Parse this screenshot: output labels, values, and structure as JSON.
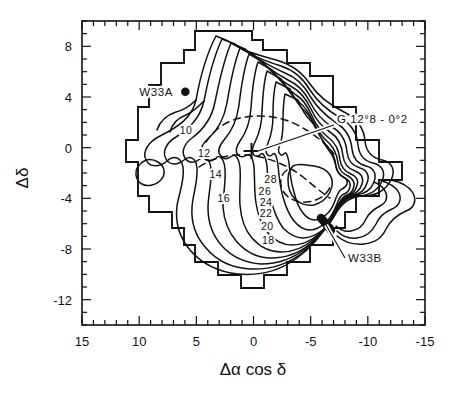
{
  "figure": {
    "kind": "contour-map",
    "caption_absent": true
  },
  "axes": {
    "x": {
      "label": "Δα  cos δ",
      "ticks": [
        15,
        10,
        5,
        0,
        -5,
        -10,
        -15
      ],
      "tick_labels": [
        "15",
        "10",
        "5",
        "0",
        "-5",
        "-10",
        "-15"
      ],
      "range": [
        15,
        -15
      ],
      "minor_step": 1,
      "direction": "reversed"
    },
    "y": {
      "label": "Δδ",
      "ticks": [
        8,
        4,
        0,
        -4,
        -8,
        -12
      ],
      "tick_labels": [
        "8",
        "4",
        "0",
        "-4",
        "-8",
        "-12"
      ],
      "range": [
        -14,
        10
      ],
      "minor_step": 1
    }
  },
  "chart_data": {
    "type": "contour",
    "title": "",
    "xlabel": "Δα  cos δ",
    "ylabel": "Δδ",
    "xlim": [
      15,
      -15
    ],
    "ylim": [
      -14,
      10
    ],
    "grid": false,
    "legend": "none",
    "contour_levels": [
      10,
      12,
      14,
      16,
      18,
      20,
      22,
      24,
      26,
      28
    ],
    "contour_label_values": [
      "10",
      "12",
      "14",
      "16",
      "18",
      "20",
      "22",
      "24",
      "26",
      "28"
    ],
    "level_step": 2,
    "peak_level": 28,
    "dashed_contours_present": true,
    "contour_labels": [
      {
        "text": "10",
        "x": 5.9,
        "y": 1.1
      },
      {
        "text": "12",
        "x": 4.3,
        "y": -0.7
      },
      {
        "text": "14",
        "x": 3.3,
        "y": -2.4
      },
      {
        "text": "16",
        "x": 2.6,
        "y": -4.3
      },
      {
        "text": "18",
        "x": -1.3,
        "y": -7.6
      },
      {
        "text": "20",
        "x": -1.2,
        "y": -6.5
      },
      {
        "text": "22",
        "x": -1.1,
        "y": -5.5
      },
      {
        "text": "24",
        "x": -1.1,
        "y": -4.6
      },
      {
        "text": "26",
        "x": -1.0,
        "y": -3.7
      },
      {
        "text": "28",
        "x": -1.5,
        "y": -2.8
      }
    ]
  },
  "markers": [
    {
      "name": "W33A",
      "label": "W33A",
      "symbol": "filled-circle",
      "x": 6.0,
      "y": 4.0
    },
    {
      "name": "W33B",
      "label": "W33B",
      "symbol": "filled-blob",
      "x": -4.6,
      "y": -6.1
    },
    {
      "name": "G12.8-0.2",
      "label": "G 12°8 - 0°2",
      "symbol": "plus",
      "x": 0.0,
      "y": 0.0
    }
  ],
  "annotations": [
    {
      "text": "W33A",
      "x": 8.6,
      "y": 4.0,
      "anchor": "end",
      "leader": false
    },
    {
      "text": "G 12°8 - 0°2",
      "x": -7.4,
      "y": 2.6,
      "anchor": "start",
      "leader": true
    },
    {
      "text": "W33B",
      "x": -7.6,
      "y": -9.2,
      "anchor": "start",
      "leader": true
    }
  ]
}
